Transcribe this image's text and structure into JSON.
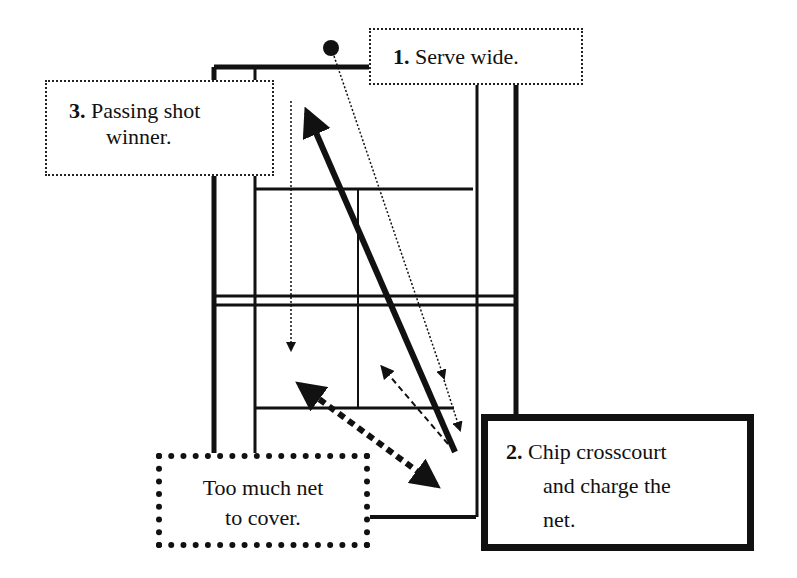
{
  "diagram": {
    "labels": [
      {
        "id": "step1",
        "number": "1.",
        "text": "Serve wide."
      },
      {
        "id": "step2",
        "number": "2.",
        "lines": [
          "Chip crosscourt",
          "and charge the",
          "net."
        ]
      },
      {
        "id": "step3",
        "number": "3.",
        "lines": [
          "Passing shot",
          "winner."
        ]
      },
      {
        "id": "note",
        "lines": [
          "Too much net",
          "to cover."
        ]
      }
    ],
    "elements": [
      "tennis-court",
      "ball",
      "serve-path",
      "chip-return-path",
      "passing-shot-path",
      "net-coverage-arrow",
      "player-movement-arrow"
    ]
  }
}
